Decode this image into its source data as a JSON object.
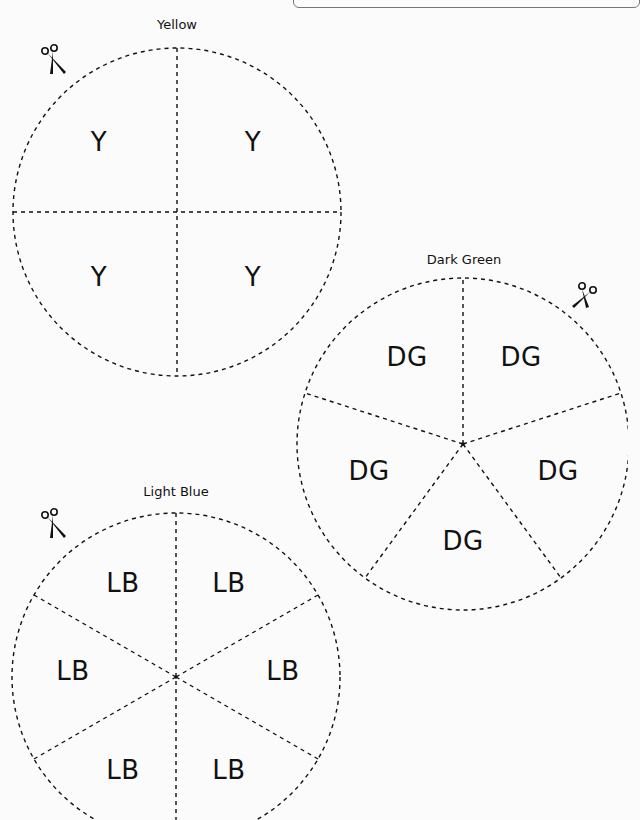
{
  "worksheet": {
    "circles": [
      {
        "name": "yellow",
        "title": "Yellow",
        "abbr": "Y",
        "sections": 4,
        "labels": [
          "Y",
          "Y",
          "Y",
          "Y"
        ]
      },
      {
        "name": "dark-green",
        "title": "Dark Green",
        "abbr": "DG",
        "sections": 5,
        "labels": [
          "DG",
          "DG",
          "DG",
          "DG",
          "DG"
        ]
      },
      {
        "name": "light-blue",
        "title": "Light Blue",
        "abbr": "LB",
        "sections": 6,
        "labels": [
          "LB",
          "LB",
          "LB",
          "LB",
          "LB",
          "LB"
        ]
      }
    ],
    "icons": {
      "scissors": "scissors-icon"
    },
    "colors": {
      "line": "#111111",
      "background": "#fbfbfb",
      "top_box_border": "#777777"
    }
  }
}
